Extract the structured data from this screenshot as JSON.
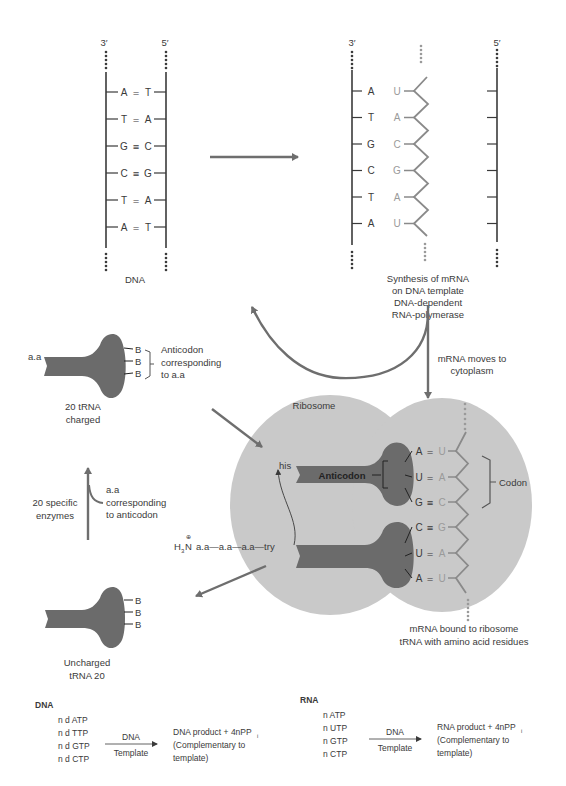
{
  "dna_panel": {
    "end_left": "3′",
    "end_right": "5′",
    "pairs": [
      {
        "left": "A",
        "bond": "=",
        "right": "T"
      },
      {
        "left": "T",
        "bond": "=",
        "right": "A"
      },
      {
        "left": "G",
        "bond": "≡",
        "right": "C"
      },
      {
        "left": "C",
        "bond": "≡",
        "right": "G"
      },
      {
        "left": "T",
        "bond": "=",
        "right": "A"
      },
      {
        "left": "A",
        "bond": "=",
        "right": "T"
      }
    ],
    "label": "DNA"
  },
  "transcription_panel": {
    "end_left": "3′",
    "end_right": "5′",
    "template_bases": [
      "A",
      "T",
      "G",
      "C",
      "T",
      "A"
    ],
    "mrna_bases": [
      "U",
      "A",
      "C",
      "G",
      "A",
      "U"
    ],
    "caption_lines": [
      "Synthesis of mRNA",
      "on DNA template",
      "DNA-dependent",
      "RNA-polymerase"
    ]
  },
  "mrna_move": {
    "caption_lines": [
      "mRNA moves to",
      "cytoplasm"
    ]
  },
  "charged_trna": {
    "aa_label": "a.a",
    "bases": [
      "B",
      "B",
      "B"
    ],
    "anticodon_note_lines": [
      "Anticodon",
      "corresponding",
      "to a.a"
    ],
    "caption_lines": [
      "20 tRNA",
      "charged"
    ]
  },
  "enzymes": {
    "left_lines": [
      "20 specific",
      "enzymes"
    ],
    "right_lines": [
      "a.a",
      "corresponding",
      "to anticodon"
    ]
  },
  "uncharged_trna": {
    "bases": [
      "B",
      "B",
      "B"
    ],
    "caption_lines": [
      "Uncharged",
      "tRNA 20"
    ]
  },
  "ribosome": {
    "label": "Ribosome",
    "anticodon_label": "Anticodon",
    "his_label": "his",
    "chain": {
      "prefix_h": "H",
      "prefix_sub": "3",
      "prefix_n": "N",
      "charge": "⊕",
      "text": "a.a—a.a—a.a—try"
    },
    "pairs": [
      {
        "trna": "A",
        "bond": "=",
        "mrna": "U"
      },
      {
        "trna": "U",
        "bond": "=",
        "mrna": "A"
      },
      {
        "trna": "G",
        "bond": "≡",
        "mrna": "C"
      },
      {
        "trna": "C",
        "bond": "≡",
        "mrna": "G"
      },
      {
        "trna": "U",
        "bond": "=",
        "mrna": "A"
      },
      {
        "trna": "A",
        "bond": "=",
        "mrna": "U"
      }
    ],
    "codon_label": "Codon",
    "caption_lines": [
      "mRNA bound to ribosome",
      "tRNA with amino acid residues"
    ]
  },
  "equations": {
    "dna": {
      "title": "DNA",
      "reactants": [
        "n d ATP",
        "n d TTP",
        "n d GTP",
        "n d CTP"
      ],
      "arrow_top": "DNA",
      "arrow_bottom": "Template",
      "product_lines": [
        "DNA product + 4nPP",
        "(Complementary to",
        "template)"
      ],
      "product_sub": "i"
    },
    "rna": {
      "title": "RNA",
      "reactants": [
        "n ATP",
        "n UTP",
        "n GTP",
        "n CTP"
      ],
      "arrow_top": "DNA",
      "arrow_bottom": "Template",
      "product_lines": [
        "RNA product + 4nPP",
        "(Complementary to",
        "template)"
      ],
      "product_sub": "i"
    }
  },
  "colors": {
    "line": "#3a3a3a",
    "arrow": "#6e6e6e",
    "ribosome": "#c9c9c9",
    "trna": "#6b6b6b",
    "mrna_text": "#9a9a9a"
  }
}
